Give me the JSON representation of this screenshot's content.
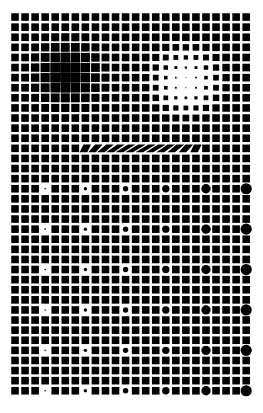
{
  "artwork": {
    "title": "Op Art Halftone Grid",
    "background_color": "#ffffff",
    "ink_color": "#000000",
    "canvas": {
      "width": 263,
      "height": 413
    }
  },
  "chart_data": {
    "type": "heatmap",
    "xlabel": "",
    "ylabel": "",
    "grid": {
      "columns": 24,
      "rows": 38,
      "origin_x": 10,
      "origin_y": 12,
      "pitch_x": 10.05,
      "pitch_y": 10.1,
      "base_square": 7.6,
      "grid_on": false,
      "legend_position": "none"
    },
    "glyph_types": [
      "square",
      "circle",
      "slash"
    ],
    "features": [
      {
        "name": "dark-blob",
        "shape": "square-dilation",
        "center_col": 5.2,
        "center_row": 5.6,
        "radius_cols": 5.0,
        "radius_rows": 5.0,
        "peak_size": 10.4,
        "description": "Squares swell toward the pitch so gaps close, forming a soft black cloud."
      },
      {
        "name": "light-blob",
        "shape": "square-erosion",
        "center_col": 17.0,
        "center_row": 6.4,
        "radius_cols": 4.6,
        "radius_rows": 4.6,
        "min_size": 0.7,
        "description": "Squares shrink to pinpoints, forming a soft white cloud."
      },
      {
        "name": "slash-band",
        "shape": "slash",
        "row": 13,
        "start_col": 6,
        "end_col": 19,
        "peak_col": 12.5,
        "max_lean": 1.0,
        "description": "A single row where squares shear into diagonal parallelograms, strongest at the middle."
      },
      {
        "name": "circle-lattice",
        "shape": "circle",
        "first_row": 17,
        "row_step": 4,
        "last_row": 37,
        "first_col": 3,
        "col_step": 4,
        "last_col": 23,
        "min_diameter": 1.6,
        "max_diameter": 11.2,
        "description": "Circles replace squares on every 4th column and row in the lower field, growing left to right."
      }
    ],
    "circle_diameters_by_column": [
      {
        "col": 3,
        "diameter": 1.6
      },
      {
        "col": 7,
        "diameter": 3.4
      },
      {
        "col": 11,
        "diameter": 5.4
      },
      {
        "col": 15,
        "diameter": 7.4
      },
      {
        "col": 19,
        "diameter": 9.3
      },
      {
        "col": 23,
        "diameter": 11.2
      }
    ],
    "circle_rows": [
      17,
      21,
      25,
      29,
      33,
      37
    ]
  }
}
